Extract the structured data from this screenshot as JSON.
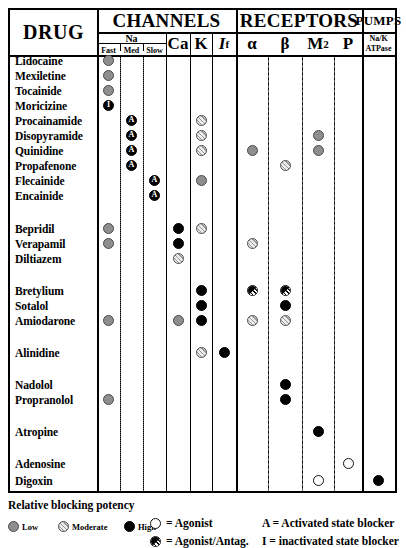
{
  "table": {
    "corner_header": "DRUG",
    "group_headers": [
      {
        "key": "channels",
        "label": "CHANNELS"
      },
      {
        "key": "receptors",
        "label": "RECEPTORS"
      },
      {
        "key": "pumps",
        "label": "PUMPS"
      }
    ],
    "na_group_label": "Na",
    "na_sub_headers": [
      "Fast",
      "Med",
      "Slow"
    ],
    "columns": [
      {
        "key": "na_fast",
        "label": "Fast"
      },
      {
        "key": "na_med",
        "label": "Med"
      },
      {
        "key": "na_slow",
        "label": "Slow"
      },
      {
        "key": "ca",
        "label": "Ca"
      },
      {
        "key": "k",
        "label": "K"
      },
      {
        "key": "if",
        "label": "I",
        "sub": "f"
      },
      {
        "key": "alpha",
        "label": "α"
      },
      {
        "key": "beta",
        "label": "β"
      },
      {
        "key": "m2",
        "label": "M",
        "sub": "2"
      },
      {
        "key": "p",
        "label": "P"
      },
      {
        "key": "nak",
        "label": "Na/K",
        "label2": "ATPase"
      }
    ],
    "rows": [
      {
        "drug": "Lidocaine",
        "marks": [
          {
            "col": "na_fast",
            "type": "low"
          }
        ]
      },
      {
        "drug": "Mexiletine",
        "marks": [
          {
            "col": "na_fast",
            "type": "low"
          }
        ]
      },
      {
        "drug": "Tocainide",
        "marks": [
          {
            "col": "na_fast",
            "type": "low"
          }
        ]
      },
      {
        "drug": "Moricizine",
        "marks": [
          {
            "col": "na_fast",
            "type": "high",
            "letter": "I"
          }
        ]
      },
      {
        "drug": "Procainamide",
        "marks": [
          {
            "col": "na_med",
            "type": "high",
            "letter": "A"
          },
          {
            "col": "k",
            "type": "mod"
          }
        ]
      },
      {
        "drug": "Disopyramide",
        "marks": [
          {
            "col": "na_med",
            "type": "high",
            "letter": "A"
          },
          {
            "col": "k",
            "type": "mod"
          },
          {
            "col": "m2",
            "type": "low"
          }
        ]
      },
      {
        "drug": "Quinidine",
        "marks": [
          {
            "col": "na_med",
            "type": "high",
            "letter": "A"
          },
          {
            "col": "k",
            "type": "mod"
          },
          {
            "col": "alpha",
            "type": "low"
          },
          {
            "col": "m2",
            "type": "low"
          }
        ]
      },
      {
        "drug": "Propafenone",
        "marks": [
          {
            "col": "na_med",
            "type": "high",
            "letter": "A"
          },
          {
            "col": "beta",
            "type": "mod"
          }
        ]
      },
      {
        "drug": "Flecainide",
        "marks": [
          {
            "col": "na_slow",
            "type": "high",
            "letter": "A"
          },
          {
            "col": "k",
            "type": "low"
          }
        ]
      },
      {
        "drug": "Encainide",
        "marks": [
          {
            "col": "na_slow",
            "type": "high",
            "letter": "A"
          }
        ]
      },
      {
        "drug": "Bepridil",
        "marks": [
          {
            "col": "na_fast",
            "type": "low"
          },
          {
            "col": "ca",
            "type": "high"
          },
          {
            "col": "k",
            "type": "mod"
          }
        ]
      },
      {
        "drug": "Verapamil",
        "marks": [
          {
            "col": "na_fast",
            "type": "low"
          },
          {
            "col": "ca",
            "type": "high"
          },
          {
            "col": "alpha",
            "type": "mod"
          }
        ]
      },
      {
        "drug": "Diltiazem",
        "marks": [
          {
            "col": "ca",
            "type": "mod"
          }
        ]
      },
      {
        "drug": "Bretylium",
        "marks": [
          {
            "col": "k",
            "type": "high"
          },
          {
            "col": "alpha",
            "type": "half"
          },
          {
            "col": "beta",
            "type": "half"
          }
        ]
      },
      {
        "drug": "Sotalol",
        "marks": [
          {
            "col": "k",
            "type": "high"
          },
          {
            "col": "beta",
            "type": "high"
          }
        ]
      },
      {
        "drug": "Amiodarone",
        "marks": [
          {
            "col": "na_fast",
            "type": "low"
          },
          {
            "col": "ca",
            "type": "low"
          },
          {
            "col": "k",
            "type": "high"
          },
          {
            "col": "alpha",
            "type": "mod"
          },
          {
            "col": "beta",
            "type": "mod"
          }
        ]
      },
      {
        "drug": "Alinidine",
        "marks": [
          {
            "col": "k",
            "type": "mod"
          },
          {
            "col": "if",
            "type": "high"
          }
        ]
      },
      {
        "drug": "Nadolol",
        "marks": [
          {
            "col": "beta",
            "type": "high"
          }
        ]
      },
      {
        "drug": "Propranolol",
        "marks": [
          {
            "col": "na_fast",
            "type": "low"
          },
          {
            "col": "beta",
            "type": "high"
          }
        ]
      },
      {
        "drug": "Atropine",
        "marks": [
          {
            "col": "m2",
            "type": "high"
          }
        ]
      },
      {
        "drug": "Adenosine",
        "marks": [
          {
            "col": "p",
            "type": "open"
          }
        ]
      },
      {
        "drug": "Digoxin",
        "marks": [
          {
            "col": "m2",
            "type": "open"
          },
          {
            "col": "nak",
            "type": "high"
          }
        ]
      }
    ]
  },
  "legend": {
    "potency_title": "Relative blocking potency",
    "potency_items": [
      {
        "type": "low",
        "label": "Low"
      },
      {
        "type": "mod",
        "label": "Moderate"
      },
      {
        "type": "high",
        "label": "High"
      }
    ],
    "symbol_items": [
      {
        "type": "open",
        "label": "= Agonist"
      },
      {
        "type": "half",
        "label": "= Agonist/Antag."
      }
    ],
    "letter_items": [
      "A = Activated state blocker",
      "I = inactivated state blocker"
    ]
  }
}
